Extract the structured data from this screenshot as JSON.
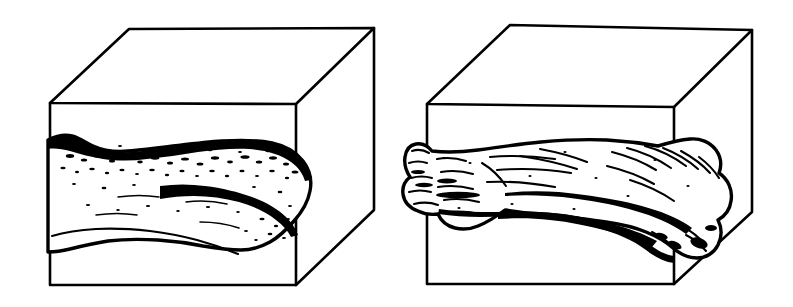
{
  "figure": {
    "title": "Fossil bone in block diagram",
    "background_color": "#ffffff",
    "ink_color": "#000000",
    "style": "black-and-white line drawing",
    "panel_count": 2
  },
  "panels": [
    {
      "id": "left",
      "name": "bone-partially-exposed",
      "label": "",
      "block": {
        "name": "sediment-block",
        "top_back_left": [
          129,
          29
        ],
        "top_back_right": [
          374,
          28
        ],
        "top_front_left": [
          50,
          103
        ],
        "top_front_right": [
          296,
          104
        ],
        "bottom_front_left": [
          50,
          285
        ],
        "bottom_front_right": [
          296,
          285
        ],
        "bottom_back_right": [
          374,
          210
        ],
        "fill": "#ffffff",
        "stroke": "#000000",
        "stroke_width": 2.6
      },
      "bone": {
        "name": "long-bone",
        "state": "partially-encased",
        "shading": "stippled-dark-contact",
        "contact_surface": "dark",
        "left_extent": 48,
        "right_extent": 312,
        "top_extent": 135,
        "bottom_extent": 252
      }
    },
    {
      "id": "right",
      "name": "bone-fully-exposed",
      "label": "",
      "block": {
        "name": "sediment-block",
        "top_back_left": [
          510,
          25
        ],
        "top_back_right": [
          752,
          30
        ],
        "top_front_left": [
          427,
          104
        ],
        "top_front_right": [
          674,
          107
        ],
        "bottom_front_left": [
          427,
          284
        ],
        "bottom_front_right": [
          674,
          284
        ],
        "bottom_back_right": [
          752,
          212
        ],
        "fill": "#ffffff",
        "stroke": "#000000",
        "stroke_width": 2.6
      },
      "bone": {
        "name": "long-bone",
        "state": "fully-exposed",
        "shading": "surface-detail-lines",
        "contact_surface": "none",
        "left_extent": 410,
        "right_extent": 703,
        "top_extent": 138,
        "bottom_extent": 258
      }
    }
  ],
  "colors": {
    "ink": "#000000",
    "paper": "#ffffff"
  }
}
